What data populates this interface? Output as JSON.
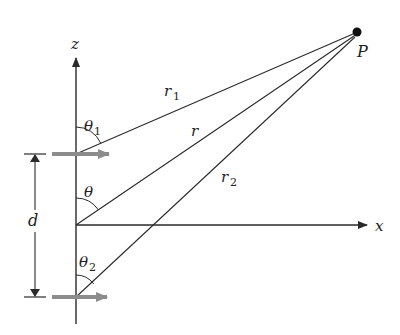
{
  "diagram": {
    "colors": {
      "line": "#2a2a2a",
      "dipole_arrow": "#8c8c8c",
      "background": "#ffffff"
    },
    "axes": {
      "z_label": "z",
      "x_label": "x"
    },
    "point": {
      "label": "P"
    },
    "distances": {
      "r1_main": "r",
      "r1_sub": "1",
      "r_main": "r",
      "r2_main": "r",
      "r2_sub": "2"
    },
    "angles": {
      "theta1_main": "θ",
      "theta1_sub": "1",
      "theta_main": "θ",
      "theta2_main": "θ",
      "theta2_sub": "2"
    },
    "separation": {
      "label": "d"
    }
  }
}
